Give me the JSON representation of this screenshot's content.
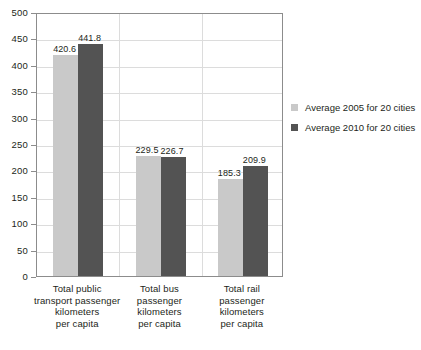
{
  "chart_data": {
    "type": "bar",
    "title": "",
    "subtitle": "",
    "xlabel": "",
    "ylabel": "",
    "ylim": [
      0,
      500
    ],
    "ytick_step": 50,
    "yticks": [
      "500",
      "450",
      "400",
      "350",
      "300",
      "250",
      "200",
      "150",
      "100",
      "50",
      "0"
    ],
    "grid": true,
    "legend_position": "right",
    "categories": [
      "Total public transport passenger kilometers per capita",
      "Total bus passenger kilometers per capita",
      "Total rail passenger kilometers per capita"
    ],
    "category_lines": [
      [
        "Total public",
        "transport passenger",
        "kilometers",
        "per capita"
      ],
      [
        "Total bus",
        "passenger",
        "kilometers",
        "per capita"
      ],
      [
        "Total rail",
        "passenger",
        "kilometers",
        "per capita"
      ]
    ],
    "series": [
      {
        "name": "Average 2005 for 20 cities",
        "color": "#c9c9c9",
        "values": [
          420.6,
          229.5,
          185.3
        ],
        "labels": [
          "420.6",
          "229.5",
          "185.3"
        ]
      },
      {
        "name": "Average 2010 for 20 cities",
        "color": "#535353",
        "values": [
          441.8,
          226.7,
          209.9
        ],
        "labels": [
          "441.8",
          "226.7",
          "209.9"
        ]
      }
    ]
  },
  "legend": {
    "items": [
      {
        "label": "Average 2005 for 20 cities",
        "swatch": "light"
      },
      {
        "label": "Average 2010 for 20 cities",
        "swatch": "dark"
      }
    ]
  },
  "colors": {
    "series_2005": "#c9c9c9",
    "series_2010": "#535353",
    "axis": "#8c8c8c",
    "gridline": "#dcdcdc",
    "text": "#231f20",
    "background": "#ffffff"
  }
}
